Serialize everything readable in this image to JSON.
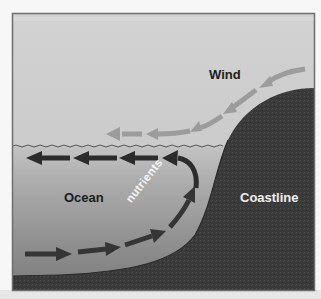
{
  "diagram": {
    "labels": {
      "wind": "Wind",
      "ocean": "Ocean",
      "coastline": "Coastline",
      "nutrients": "nutrients"
    },
    "regions": [
      {
        "name": "sky",
        "color": "#cfcfcf"
      },
      {
        "name": "ocean-surface",
        "color": "#bdbdbd"
      },
      {
        "name": "ocean-deep",
        "color": "#8f8f8f"
      },
      {
        "name": "coastline-land",
        "color": "#3b3b3b"
      }
    ],
    "flows": [
      {
        "name": "wind",
        "direction": "from upper-right down toward left along surface",
        "arrow_count": 5,
        "color": "#9a9a9a"
      },
      {
        "name": "surface-current",
        "direction": "offshore (right to left)",
        "arrow_count": 4,
        "color": "#2e2e2e"
      },
      {
        "name": "deep-upwelling",
        "direction": "onshore along seafloor then upward",
        "arrow_count": 4,
        "color": "#3a3a3a"
      }
    ],
    "colors": {
      "frame": "#6e6e6e",
      "background": "#f7f7f7",
      "waterline": "#555555"
    }
  }
}
